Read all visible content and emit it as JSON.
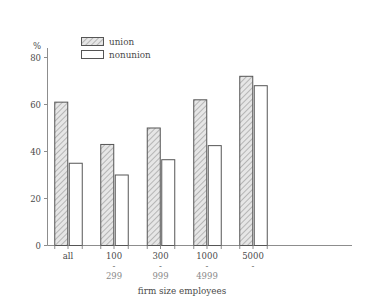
{
  "chart_data": {
    "type": "bar",
    "title": "",
    "subtitle": "",
    "xlabel": "firm size employees",
    "ylabel": "%",
    "ylim": [
      0,
      85
    ],
    "yticks": [
      0,
      20,
      40,
      60,
      80
    ],
    "ytick_labels": [
      "0",
      "20",
      "40",
      "60",
      "80"
    ],
    "grid": false,
    "legend_position": "top-left-inside",
    "categories": [
      "all",
      "100 - 299",
      "300 - 999",
      "1000 - 4999",
      "5000 -"
    ],
    "category_lines": [
      {
        "top": "all",
        "sep": "",
        "bottom": ""
      },
      {
        "top": "100",
        "sep": "-",
        "bottom": "299"
      },
      {
        "top": "300",
        "sep": "-",
        "bottom": "999"
      },
      {
        "top": "1000",
        "sep": "-",
        "bottom": "4999"
      },
      {
        "top": "5000",
        "sep": "-",
        "bottom": ""
      }
    ],
    "series": [
      {
        "name": "union",
        "values": [
          61,
          43,
          50,
          62,
          72
        ]
      },
      {
        "name": "nonunion",
        "values": [
          35,
          30,
          36.5,
          42.5,
          68
        ]
      }
    ],
    "colors": {
      "union_fill": "#d9d9d9",
      "union_hatch": "#8c8c8c",
      "nonunion_fill": "#ffffff",
      "bar_outline": "#555555",
      "axis": "#8d8d8d",
      "text": "#4a4a4a"
    }
  },
  "legend": {
    "items": [
      {
        "label": "union"
      },
      {
        "label": "nonunion"
      }
    ]
  },
  "axes": {
    "y_unit_label": "%",
    "x_axis_title": "firm size employees"
  }
}
